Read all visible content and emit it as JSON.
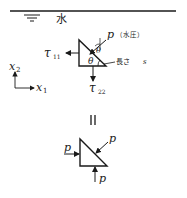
{
  "top_figure": {
    "water_label": "水",
    "pressure_label": "p",
    "pressure_note": "（水圧）",
    "theta_upper": "θ",
    "theta_lower": "θ",
    "length_label": "長さ",
    "length_var": "s",
    "tau11": {
      "symbol": "τ",
      "sub": "11"
    },
    "tau22": {
      "symbol": "τ",
      "sub": "22"
    },
    "axis_x1": {
      "symbol": "x",
      "sub": "1"
    },
    "axis_x2": {
      "symbol": "x",
      "sub": "2"
    }
  },
  "equals_sign": "II",
  "bottom_figure": {
    "p_left": "p",
    "p_hyp": "p",
    "p_bottom": "p"
  },
  "colors": {
    "ink": "#1a1a1a",
    "background": "#ffffff"
  }
}
